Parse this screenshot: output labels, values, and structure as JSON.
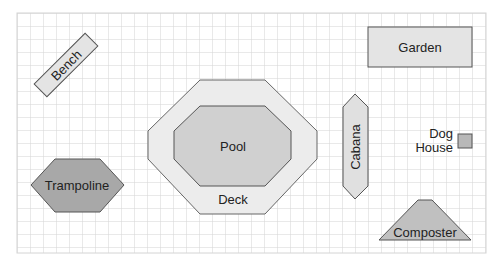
{
  "diagram": {
    "grid": {
      "x": 17,
      "y": 13,
      "width": 469,
      "height": 240,
      "cell": 13,
      "line_color": "#d4d4d4"
    },
    "colors": {
      "stroke": "#555555",
      "light_fill": "#e4e4e4",
      "mid_fill": "#d0d0d0",
      "dark_fill": "#b0b0b0"
    },
    "items": [
      {
        "id": "bench",
        "label": "Bench"
      },
      {
        "id": "garden",
        "label": "Garden"
      },
      {
        "id": "pool",
        "label": "Pool"
      },
      {
        "id": "deck",
        "label": "Deck"
      },
      {
        "id": "cabana",
        "label": "Cabana"
      },
      {
        "id": "dog-house",
        "label_line1": "Dog",
        "label_line2": "House"
      },
      {
        "id": "trampoline",
        "label": "Trampoline"
      },
      {
        "id": "composter",
        "label": "Composter"
      }
    ]
  }
}
